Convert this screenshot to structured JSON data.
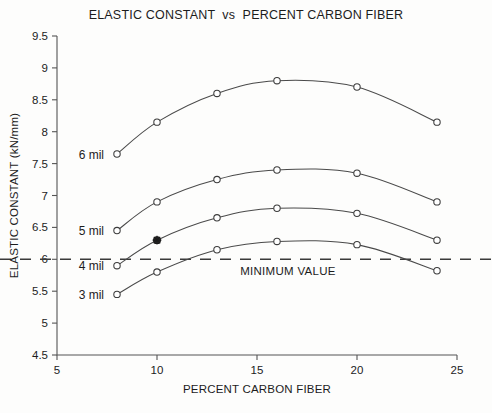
{
  "chart_data": {
    "type": "line",
    "title": "ELASTIC CONSTANT  vs  PERCENT CARBON FIBER",
    "xlabel": "PERCENT CARBON FIBER",
    "ylabel": "ELASTIC CONSTANT (kN/mm)",
    "xlim": [
      5,
      25
    ],
    "ylim": [
      4.5,
      9.5
    ],
    "xticks": [
      5,
      10,
      15,
      20,
      25
    ],
    "xtick_labels": [
      "5",
      "10",
      "15",
      "20",
      "25"
    ],
    "yticks": [
      4.5,
      5,
      5.5,
      6,
      6.5,
      7,
      7.5,
      8,
      8.5,
      9,
      9.5
    ],
    "ytick_labels": [
      "4.5",
      "5",
      "5.5",
      "6",
      "6.5",
      "7",
      "7.5",
      "8",
      "8.5",
      "9",
      "9.5"
    ],
    "grid": false,
    "legend_position": "inline-left-of-curves",
    "x": [
      8,
      10,
      13,
      16,
      20,
      24
    ],
    "series": [
      {
        "name": "6 mil",
        "label": "6 mil",
        "values": [
          7.65,
          8.15,
          8.6,
          8.8,
          8.7,
          8.15
        ],
        "marker": "open-circle"
      },
      {
        "name": "5 mil",
        "label": "5 mil",
        "values": [
          6.45,
          6.9,
          7.25,
          7.4,
          7.35,
          6.9
        ],
        "marker": "open-circle"
      },
      {
        "name": "4 mil",
        "label": "4 mil",
        "values": [
          5.9,
          6.3,
          6.65,
          6.8,
          6.72,
          6.3
        ],
        "marker": "open-circle"
      },
      {
        "name": "3 mil",
        "label": "3 mil",
        "values": [
          5.45,
          5.8,
          6.15,
          6.28,
          6.23,
          5.82
        ],
        "marker": "open-circle"
      }
    ],
    "annotations": [
      {
        "text": "MINIMUM VALUE",
        "type": "hline-label",
        "y": 6.0
      }
    ],
    "reference_line": {
      "label": "MINIMUM VALUE",
      "y": 6.0,
      "style": "dashed"
    },
    "highlighted_point": {
      "series": "4 mil",
      "x": 10,
      "y": 6.3,
      "marker": "filled-asterisk"
    }
  },
  "series_labels": {
    "s0": "6 mil",
    "s1": "5 mil",
    "s2": "4 mil",
    "s3": "3 mil"
  },
  "colors": {
    "line": "#4a4a4a",
    "axis": "#555555",
    "text": "#1c1c1c",
    "background": "#fdfdfc"
  }
}
